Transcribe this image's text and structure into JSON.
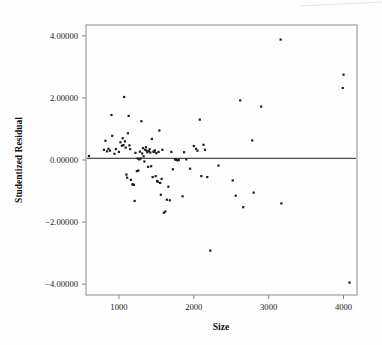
{
  "chart_data": {
    "type": "scatter",
    "title": "",
    "xlabel": "Size",
    "ylabel": "Studentized Residual",
    "xlim": [
      560,
      4180
    ],
    "ylim": [
      -4.35,
      4.35
    ],
    "xticks": [
      1000,
      2000,
      3000,
      4000
    ],
    "xtick_labels": [
      "1000",
      "2000",
      "3000",
      "4000"
    ],
    "yticks": [
      4,
      2,
      0,
      -2,
      -4
    ],
    "ytick_labels": [
      "4.00000",
      "2.00000",
      "0.00000",
      "-2.00000",
      "-4.00000"
    ],
    "grid": false,
    "legend": null,
    "reference_line": {
      "orientation": "horizontal",
      "y": 0.05,
      "color": "#4a4a4a"
    },
    "marker": {
      "shape": "square",
      "size": 2.2,
      "color": "#1b1b1b"
    },
    "points": [
      [
        600,
        0.13
      ],
      [
        800,
        0.33
      ],
      [
        820,
        0.62
      ],
      [
        840,
        0.28
      ],
      [
        860,
        0.36
      ],
      [
        880,
        0.3
      ],
      [
        900,
        1.45
      ],
      [
        910,
        0.78
      ],
      [
        940,
        0.2
      ],
      [
        960,
        0.35
      ],
      [
        1000,
        0.26
      ],
      [
        1020,
        0.57
      ],
      [
        1040,
        0.46
      ],
      [
        1050,
        0.7
      ],
      [
        1060,
        0.48
      ],
      [
        1070,
        2.03
      ],
      [
        1080,
        0.6
      ],
      [
        1090,
        0.4
      ],
      [
        1100,
        -0.47
      ],
      [
        1110,
        -0.57
      ],
      [
        1120,
        0.86
      ],
      [
        1130,
        1.42
      ],
      [
        1140,
        0.47
      ],
      [
        1150,
        0.35
      ],
      [
        1160,
        -0.64
      ],
      [
        1180,
        -0.78
      ],
      [
        1190,
        -0.8
      ],
      [
        1200,
        -0.8
      ],
      [
        1210,
        -1.32
      ],
      [
        1220,
        0.23
      ],
      [
        1240,
        -0.36
      ],
      [
        1250,
        0.05
      ],
      [
        1260,
        -0.34
      ],
      [
        1270,
        0.02
      ],
      [
        1280,
        0.27
      ],
      [
        1290,
        0.05
      ],
      [
        1300,
        1.25
      ],
      [
        1310,
        0.21
      ],
      [
        1320,
        0.38
      ],
      [
        1330,
        0.12
      ],
      [
        1340,
        -0.05
      ],
      [
        1350,
        0.33
      ],
      [
        1360,
        0.41
      ],
      [
        1370,
        0.3
      ],
      [
        1380,
        0.25
      ],
      [
        1390,
        -0.22
      ],
      [
        1400,
        0.29
      ],
      [
        1410,
        0.35
      ],
      [
        1420,
        0.24
      ],
      [
        1430,
        -0.2
      ],
      [
        1440,
        0.68
      ],
      [
        1450,
        -0.55
      ],
      [
        1460,
        0.27
      ],
      [
        1470,
        0.26
      ],
      [
        1480,
        0.31
      ],
      [
        1490,
        -0.52
      ],
      [
        1500,
        0.22
      ],
      [
        1510,
        -0.68
      ],
      [
        1520,
        -0.7
      ],
      [
        1530,
        0.26
      ],
      [
        1540,
        0.95
      ],
      [
        1550,
        -0.74
      ],
      [
        1560,
        -1.12
      ],
      [
        1570,
        -0.61
      ],
      [
        1580,
        0.33
      ],
      [
        1600,
        -1.7
      ],
      [
        1620,
        -1.66
      ],
      [
        1640,
        -1.28
      ],
      [
        1660,
        -0.86
      ],
      [
        1680,
        -1.3
      ],
      [
        1700,
        0.26
      ],
      [
        1720,
        -0.3
      ],
      [
        1750,
        0.02
      ],
      [
        1760,
        0.01
      ],
      [
        1780,
        -0.01
      ],
      [
        1800,
        0.0
      ],
      [
        1850,
        -1.17
      ],
      [
        1870,
        0.25
      ],
      [
        1900,
        0.02
      ],
      [
        1950,
        -0.28
      ],
      [
        2000,
        0.45
      ],
      [
        2030,
        0.36
      ],
      [
        2050,
        0.3
      ],
      [
        2080,
        1.3
      ],
      [
        2100,
        -0.52
      ],
      [
        2130,
        0.49
      ],
      [
        2150,
        0.33
      ],
      [
        2180,
        -0.55
      ],
      [
        2220,
        -2.92
      ],
      [
        2330,
        -0.18
      ],
      [
        2520,
        -0.66
      ],
      [
        2560,
        -1.15
      ],
      [
        2620,
        1.92
      ],
      [
        2660,
        -1.52
      ],
      [
        2780,
        0.63
      ],
      [
        2800,
        -1.05
      ],
      [
        2900,
        1.72
      ],
      [
        3160,
        3.88
      ],
      [
        3170,
        -1.4
      ],
      [
        3990,
        2.32
      ],
      [
        4000,
        2.75
      ],
      [
        4080,
        -3.95
      ]
    ]
  },
  "plot_geometry": {
    "left": 86,
    "right": 357,
    "top": 25,
    "bottom": 295
  }
}
